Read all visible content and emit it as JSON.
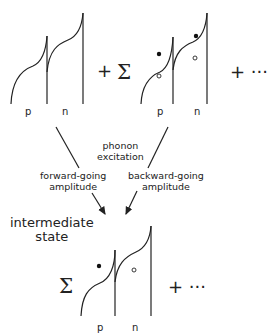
{
  "diagram": {
    "top_row": {
      "term1": {
        "labels": [
          "p",
          "n"
        ]
      },
      "op1": "+",
      "sum_symbol": "Σ",
      "term2": {
        "labels": [
          "p",
          "n"
        ],
        "markers": [
          "filled-dot",
          "open-circle",
          "filled-dot",
          "open-circle"
        ]
      },
      "op2": "+ ···"
    },
    "center_label": [
      "phonon",
      "excitation"
    ],
    "left_arrow_label": [
      "forward-going",
      "amplitude"
    ],
    "right_arrow_label": [
      "backward-going",
      "amplitude"
    ],
    "intermediate_label": [
      "intermediate",
      "state"
    ],
    "bottom_row": {
      "sum_symbol": "Σ",
      "term": {
        "labels": [
          "p",
          "n"
        ],
        "markers": [
          "filled-dot",
          "open-circle"
        ]
      },
      "op": "+ ···"
    }
  }
}
